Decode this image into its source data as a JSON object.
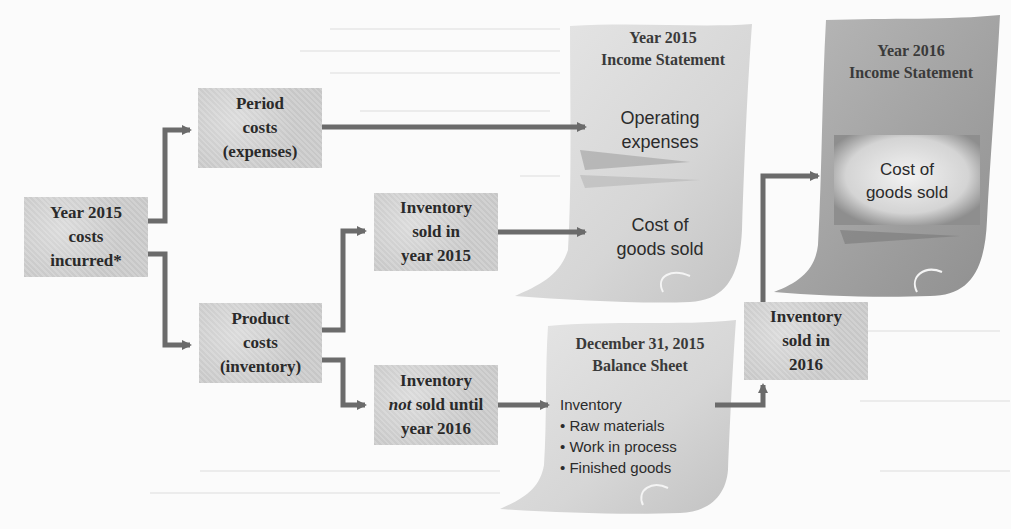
{
  "diagram": {
    "type": "flowchart",
    "colors": {
      "box_fill": "#cfcfcf",
      "arrow": "#6b6b6b",
      "doc_light": "#dedede",
      "doc_dark": "#9a9a9a",
      "text": "#2a2a2a"
    },
    "nodes": {
      "costs_incurred": {
        "lines": [
          "Year 2015",
          "costs",
          "incurred*"
        ]
      },
      "period_costs": {
        "lines": [
          "Period",
          "costs",
          "(expenses)"
        ]
      },
      "product_costs": {
        "lines": [
          "Product",
          "costs",
          "(inventory)"
        ]
      },
      "inventory_sold_2015": {
        "lines": [
          "Inventory",
          "sold in",
          "year 2015"
        ]
      },
      "inventory_not_sold": {
        "lines": [
          "Inventory",
          "sold until",
          "year 2016"
        ],
        "emphasis": "not"
      },
      "inventory_sold_2016": {
        "lines": [
          "Inventory",
          "sold in",
          "2016"
        ]
      }
    },
    "documents": {
      "income_2015": {
        "title": [
          "Year 2015",
          "Income Statement"
        ],
        "items": {
          "operating": [
            "Operating",
            "expenses"
          ],
          "cogs": [
            "Cost of",
            "goods sold"
          ]
        }
      },
      "balance_2015": {
        "title": [
          "December 31, 2015",
          "Balance Sheet"
        ],
        "heading": "Inventory",
        "bullets": [
          "• Raw materials",
          "• Work in process",
          "• Finished goods"
        ]
      },
      "income_2016": {
        "title": [
          "Year 2016",
          "Income Statement"
        ],
        "items": {
          "cogs": [
            "Cost of",
            "goods sold"
          ]
        }
      }
    },
    "edges": [
      {
        "from": "costs_incurred",
        "to": "period_costs"
      },
      {
        "from": "costs_incurred",
        "to": "product_costs"
      },
      {
        "from": "period_costs",
        "to": "income_2015.operating"
      },
      {
        "from": "product_costs",
        "to": "inventory_sold_2015"
      },
      {
        "from": "product_costs",
        "to": "inventory_not_sold"
      },
      {
        "from": "inventory_sold_2015",
        "to": "income_2015.cogs"
      },
      {
        "from": "inventory_not_sold",
        "to": "balance_2015.inventory"
      },
      {
        "from": "balance_2015.inventory",
        "to": "inventory_sold_2016"
      },
      {
        "from": "inventory_sold_2016",
        "to": "income_2016.cogs"
      }
    ]
  }
}
